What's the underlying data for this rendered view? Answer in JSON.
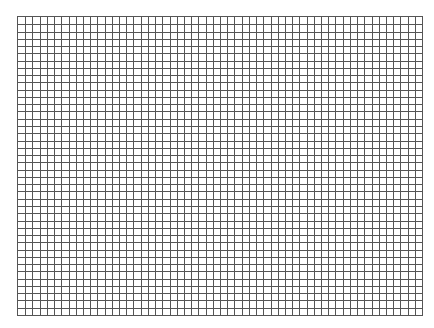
{
  "grid": {
    "columns": 56,
    "rows": 41,
    "line_color": "#555555",
    "background_color": "#ffffff"
  }
}
